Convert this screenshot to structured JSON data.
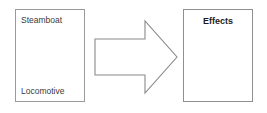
{
  "diagram": {
    "background_color": "#ffffff",
    "source_box": {
      "border_color": "#9a9a9a",
      "label_top": "Steamboat",
      "label_bottom": "Locomotive"
    },
    "arrow": {
      "name": "right-arrow-icon",
      "direction": "right",
      "stroke_color": "#8a8a8a",
      "fill_color": "#ffffff"
    },
    "target_box": {
      "border_color": "#8f8f8f",
      "title": "Effects"
    }
  }
}
